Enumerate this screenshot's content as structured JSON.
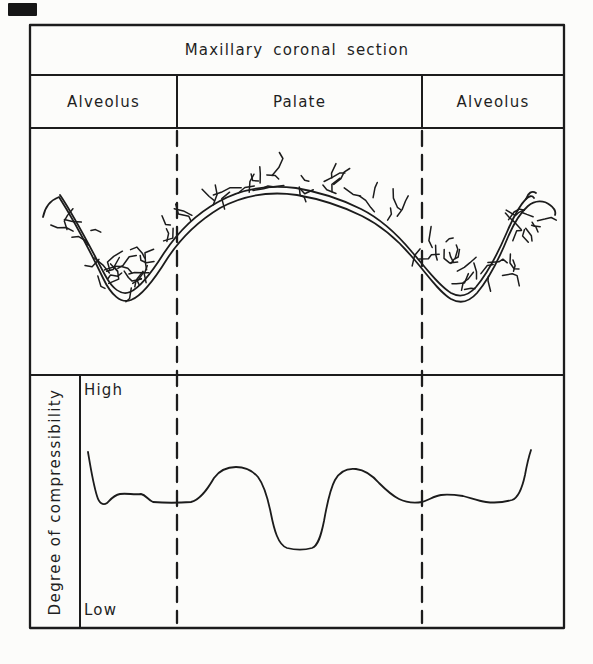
{
  "figure": {
    "title": "Maxillary coronal section",
    "regions": [
      {
        "label": "Alveolus"
      },
      {
        "label": "Palate"
      },
      {
        "label": "Alveolus"
      }
    ],
    "graph": {
      "ylabel": "Degree of compressibility",
      "top_label": "High",
      "bottom_label": "Low"
    },
    "colors": {
      "ink": "#1c1c1c",
      "paper": "#fcfcfa"
    }
  },
  "chart_data": {
    "type": "line",
    "ylabel": "Degree of compressibility",
    "y_axis": {
      "top": "High",
      "bottom": "Low",
      "scale": "qualitative 0=Low 1=High"
    },
    "x_regions": [
      "Alveolus",
      "Palate",
      "Alveolus"
    ],
    "region_boundaries_x_norm": [
      0.2,
      0.71
    ],
    "x_norm": [
      0.02,
      0.04,
      0.06,
      0.08,
      0.13,
      0.15,
      0.23,
      0.28,
      0.32,
      0.37,
      0.39,
      0.43,
      0.48,
      0.5,
      0.53,
      0.57,
      0.62,
      0.66,
      0.71,
      0.75,
      0.79,
      0.84,
      0.89,
      0.92,
      0.93
    ],
    "value_norm": [
      0.71,
      0.52,
      0.49,
      0.53,
      0.53,
      0.49,
      0.49,
      0.6,
      0.64,
      0.6,
      0.44,
      0.29,
      0.29,
      0.41,
      0.59,
      0.63,
      0.57,
      0.5,
      0.49,
      0.52,
      0.52,
      0.49,
      0.5,
      0.61,
      0.72
    ],
    "annotations": "Compressibility is moderate/low over the alveolar ridges, rises on the palatal slopes, and drops sharply to a minimum at the mid-palate (median raphe)."
  },
  "geometry": {
    "anatomy_inner": "M 60 195 C 75 217, 91 249, 105 275 C 112 288, 121 296, 130 292 C 140 288, 152 272, 164 253 C 180 229, 198 213, 218 202 C 242 188, 270 185, 296 188 C 320 192, 341 199, 361 209 C 381 219, 397 234, 412 252 C 426 268, 438 285, 451 293 C 460 298, 468 296, 476 287 C 487 274, 498 253, 507 232 C 513 218, 520 205, 526 199 C 529 196, 532 195, 534 198",
    "anatomy_outer": "M 43 217 C 45 207, 51 200, 59 197 C 75 222, 90 251, 103 278 C 111 295, 121 304, 131 300 C 142 296, 154 280, 167 259 C 182 236, 200 220, 220 208 C 244 195, 270 191, 297 195 C 320 199, 342 206, 362 216 C 382 226, 398 240, 413 258 C 427 274, 438 291, 451 299 C 460 304, 469 302, 477 293 C 488 280, 499 259, 508 237 C 514 223, 521 212, 528 206 C 535 200, 544 200, 550 205 C 554 208, 556 212, 555 215",
    "anatomy_end_curl": "M 526 199 C 528 193, 532 190, 536 193",
    "graph_curve": "M 88 452 C 90 464, 93 483, 97 496 C 99 503, 103 506, 107 503 C 111 499, 114 495, 120 494 C 127 493, 134 495, 141 494 C 146 495, 148 500, 153 502 C 165 503, 178 503, 191 502 C 200 500, 207 490, 214 478 C 219 471, 227 467, 236 467 C 245 467, 252 470, 258 477 C 264 485, 268 499, 271 514 C 274 529, 278 545, 287 548 C 295 550, 305 550, 312 548 C 318 546, 321 536, 324 521 C 327 504, 330 489, 335 480 C 340 471, 348 468, 356 469 C 365 470, 372 475, 379 483 C 385 489, 391 495, 399 499 C 407 503, 415 503, 422 502 C 429 500, 434 496, 441 495 C 449 494, 456 495, 463 496 C 471 498, 478 501, 486 502 C 494 503, 505 502, 512 500 C 518 498, 522 489, 525 475 C 527 464, 529 456, 531 450",
    "hatch_zones": [
      {
        "pts": [
          [
            74,
            224
          ],
          [
            90,
            248
          ],
          [
            105,
            268
          ],
          [
            120,
            280
          ],
          [
            137,
            270
          ],
          [
            152,
            249
          ],
          [
            166,
            231
          ],
          [
            177,
            220
          ]
        ],
        "hw": 20,
        "n": 30
      },
      {
        "pts": [
          [
            202,
            206
          ],
          [
            232,
            193
          ],
          [
            262,
            184
          ],
          [
            292,
            180
          ],
          [
            322,
            184
          ],
          [
            352,
            192
          ],
          [
            382,
            204
          ],
          [
            404,
            214
          ]
        ],
        "hw": 9,
        "n": 26
      },
      {
        "pts": [
          [
            420,
            238
          ],
          [
            437,
            257
          ],
          [
            453,
            272
          ],
          [
            470,
            281
          ],
          [
            488,
            271
          ],
          [
            505,
            250
          ],
          [
            519,
            232
          ],
          [
            530,
            219
          ]
        ],
        "hw": 20,
        "n": 30
      }
    ]
  }
}
